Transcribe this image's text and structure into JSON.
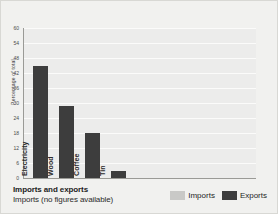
{
  "chart_data": {
    "type": "bar",
    "title": "Imports and exports",
    "subtitle": "Imports (no figures available)",
    "categories": [
      "Electricity",
      "Wood",
      "Coffee",
      "Tin"
    ],
    "series": [
      {
        "name": "Imports",
        "values": [
          null,
          null,
          null,
          null
        ],
        "color": "#c9c9c7"
      },
      {
        "name": "Exports",
        "values": [
          45,
          29,
          18,
          3
        ],
        "color": "#3d3d3d"
      }
    ],
    "xlabel": "",
    "ylabel": "Percentage of total",
    "ylim": [
      0,
      60
    ],
    "yticks": [
      0,
      6,
      12,
      18,
      24,
      30,
      36,
      42,
      48,
      54,
      60
    ],
    "ytick_labels": [
      "0",
      "6",
      "12",
      "18",
      "24",
      "30",
      "36",
      "42",
      "48",
      "54",
      "60"
    ],
    "grid": true,
    "legend_position": "bottom-right"
  },
  "legend": {
    "items": [
      {
        "label": "Imports",
        "color": "#c9c9c7"
      },
      {
        "label": "Exports",
        "color": "#3d3d3d"
      }
    ]
  },
  "colors": {
    "background": "#f1f1ef",
    "plot_background": "#ececeb",
    "gridline": "#fbfbfa",
    "axis": "#9a9a96",
    "exports_bar": "#3d3d3d",
    "imports_bar": "#c9c9c7"
  }
}
